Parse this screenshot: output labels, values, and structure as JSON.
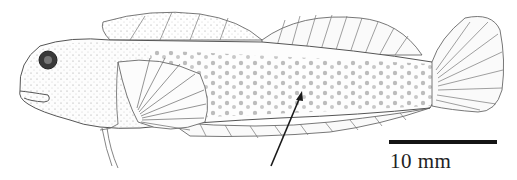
{
  "figure": {
    "scale_bar": {
      "label": "10 mm"
    },
    "annotation": {
      "type": "arrow",
      "target": "mid-body lateral marking"
    },
    "colors": {
      "ink": "#2a2a2a",
      "background": "#ffffff",
      "scale_bar": "#141414"
    }
  }
}
